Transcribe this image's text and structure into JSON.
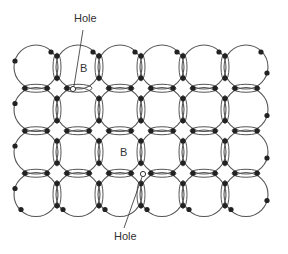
{
  "diagram": {
    "title": "",
    "labels": {
      "hole_top": "Hole",
      "hole_bottom": "Hole",
      "b_top": "B",
      "b_bottom": "B"
    },
    "grid": {
      "columns": 6,
      "rows": 4
    },
    "colors": {
      "line": "#444444",
      "atom": "#222222",
      "hole_fill": "#ffffff"
    }
  }
}
